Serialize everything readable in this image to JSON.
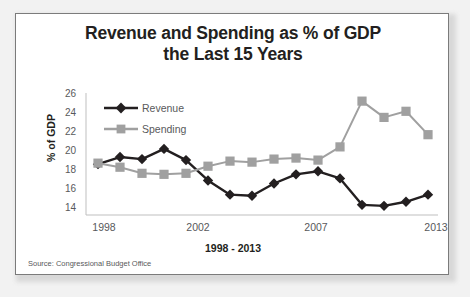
{
  "chart_data": {
    "type": "line",
    "title": "Revenue and Spending as % of GDP the Last 15 Years",
    "title_line1": "Revenue and Spending as % of GDP",
    "title_line2": "the Last 15 Years",
    "xlabel": "1998 - 2013",
    "ylabel": "% of GDP",
    "source": "Source: Congressional Budget Office",
    "x": [
      1998,
      1999,
      2000,
      2001,
      2002,
      2003,
      2004,
      2005,
      2006,
      2007,
      2008,
      2009,
      2010,
      2011,
      2012,
      2013
    ],
    "xtick_labels": [
      "1998",
      "2002",
      "2007",
      "2013"
    ],
    "xtick_values": [
      1998,
      2002,
      2007,
      2013
    ],
    "ytick_labels": [
      "26",
      "24",
      "22",
      "20",
      "18",
      "16",
      "14"
    ],
    "ytick_values": [
      26,
      24,
      22,
      20,
      18,
      16,
      14
    ],
    "ylim": [
      14,
      26
    ],
    "grid": false,
    "legend_position": "top-left",
    "series": [
      {
        "name": "Revenue",
        "color": "#231f20",
        "marker": "diamond",
        "values": [
          19.0,
          19.7,
          19.5,
          20.5,
          19.4,
          17.4,
          16.0,
          15.9,
          17.1,
          18.0,
          18.3,
          17.6,
          15.0,
          14.9,
          15.3,
          16.0
        ]
      },
      {
        "name": "Spending",
        "color": "#a0a0a0",
        "marker": "square",
        "values": [
          19.1,
          18.7,
          18.1,
          18.0,
          18.1,
          18.8,
          19.3,
          19.2,
          19.5,
          19.6,
          19.4,
          20.7,
          25.2,
          23.6,
          24.2,
          21.9
        ]
      }
    ]
  }
}
